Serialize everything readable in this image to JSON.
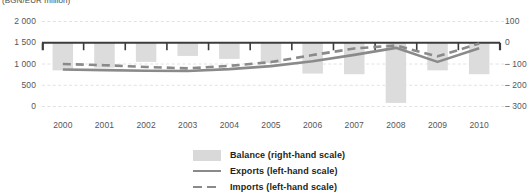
{
  "chart_data": {
    "type": "bar",
    "title": "",
    "unit_label": "(BGN/EUR million)",
    "categories": [
      "2000",
      "2001",
      "2002",
      "2003",
      "2004",
      "2005",
      "2006",
      "2007",
      "2008",
      "2009",
      "2010"
    ],
    "xlabel": "",
    "ylabel_left": "",
    "ylabel_right": "",
    "ylim_left": [
      0,
      2000
    ],
    "ylim_right": [
      -300,
      100
    ],
    "left_ticks": [
      "0",
      "500",
      "1 000",
      "1 500",
      "2 000"
    ],
    "left_tick_values": [
      0,
      500,
      1000,
      1500,
      2000
    ],
    "right_ticks": [
      "– 300",
      "– 200",
      "– 100",
      "0",
      "100"
    ],
    "right_tick_values": [
      -300,
      -200,
      -100,
      0,
      100
    ],
    "grid": true,
    "legend_position": "bottom-center",
    "series": [
      {
        "name": "Balance (right-hand scale)",
        "type": "bar",
        "scale": "right",
        "color": "#dcdcdc",
        "values": [
          -130,
          -117,
          -90,
          -62,
          -76,
          -95,
          -145,
          -148,
          -283,
          -130,
          -148
        ]
      },
      {
        "name": "Exports (left-hand scale)",
        "type": "line",
        "style": "solid",
        "scale": "left",
        "color": "#8a8a8a",
        "values": [
          870,
          855,
          840,
          835,
          880,
          950,
          1065,
          1215,
          1380,
          1050,
          1370
        ]
      },
      {
        "name": "Imports (left-hand scale)",
        "type": "line",
        "style": "dashed",
        "scale": "left",
        "color": "#8a8a8a",
        "values": [
          1000,
          972,
          930,
          897,
          956,
          1045,
          1210,
          1365,
          1435,
          1180,
          1480
        ]
      }
    ]
  },
  "legend": {
    "items": [
      {
        "label": "Balance (right-hand scale)",
        "key": "bar"
      },
      {
        "label": "Exports (left-hand scale)",
        "key": "solid"
      },
      {
        "label": "Imports (left-hand scale)",
        "key": "dashed"
      }
    ]
  },
  "colors": {
    "bar": "#dcdcdc",
    "line": "#8a8a8a",
    "axis": "#3c3c3c",
    "grid": "#e2e2e2",
    "text": "#55565a",
    "legend_text": "#231f20"
  }
}
